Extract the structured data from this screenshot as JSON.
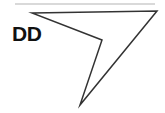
{
  "canvas": {
    "width": 165,
    "height": 113,
    "background_color": "#ffffff"
  },
  "rule": {
    "name": "top-divider",
    "x1": 15,
    "y1": 4,
    "x2": 155,
    "y2": 4,
    "color": "#d9d9d9",
    "stroke_width": 2
  },
  "figure": {
    "label": "DD",
    "label_position": {
      "x": 12,
      "y": 23
    },
    "label_color": "#111111",
    "stroke_color": "#333333",
    "fill": "none",
    "stroke_width": 1.5,
    "vertex_count": 4,
    "points": "32,13 157,11 80,105 102,40",
    "vertices": [
      {
        "name": "left-vertex",
        "x": 32,
        "y": 13
      },
      {
        "name": "right-apex-vertex",
        "x": 157,
        "y": 11
      },
      {
        "name": "bottom-vertex",
        "x": 80,
        "y": 105
      },
      {
        "name": "concave-vertex",
        "x": 102,
        "y": 40
      }
    ],
    "edges": [
      {
        "name": "top-edge",
        "from": "left-vertex",
        "to": "right-apex-vertex"
      },
      {
        "name": "right-edge",
        "from": "right-apex-vertex",
        "to": "bottom-vertex"
      },
      {
        "name": "lower-left-edge",
        "from": "bottom-vertex",
        "to": "concave-vertex"
      },
      {
        "name": "upper-left-edge",
        "from": "concave-vertex",
        "to": "left-vertex"
      }
    ]
  }
}
